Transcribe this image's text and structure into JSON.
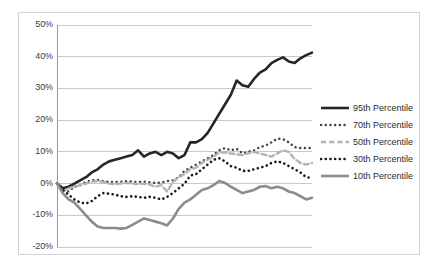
{
  "chart_data": {
    "type": "line",
    "title": "",
    "xlabel": "",
    "ylabel": "",
    "ylim": [
      -20,
      50
    ],
    "ytick_labels": [
      "50%",
      "40%",
      "30%",
      "20%",
      "10%",
      "0%",
      "-10%",
      "-20%"
    ],
    "ytick_values": [
      50,
      40,
      30,
      20,
      10,
      0,
      -10,
      -20
    ],
    "xlim": [
      0,
      44
    ],
    "xtick_labels": [],
    "grid": "horizontal",
    "legend_position": "right",
    "x": [
      0,
      1,
      2,
      3,
      4,
      5,
      6,
      7,
      8,
      9,
      10,
      11,
      12,
      13,
      14,
      15,
      16,
      17,
      18,
      19,
      20,
      21,
      22,
      23,
      24,
      25,
      26,
      27,
      28,
      29,
      30,
      31,
      32,
      33,
      34,
      35,
      36,
      37,
      38,
      39,
      40,
      41,
      42,
      43,
      44
    ],
    "series": [
      {
        "name": "95th Percentile",
        "color": "#262626",
        "style": "solid",
        "width": 2.6,
        "values": [
          0,
          -1.5,
          -1,
          0,
          1,
          2,
          3.5,
          4.5,
          6,
          7,
          7.5,
          8,
          8.5,
          9,
          10.5,
          8.5,
          9.5,
          10,
          9,
          10,
          9.5,
          8,
          9,
          13,
          13,
          14,
          16,
          19,
          22,
          25,
          28,
          32.5,
          31,
          30.5,
          33,
          35,
          36,
          38,
          39,
          39.8,
          38.5,
          38,
          39.5,
          40.5,
          41.3
        ]
      },
      {
        "name": "70th Percentile",
        "color": "#3f3f3f",
        "style": "dotted",
        "width": 2.4,
        "values": [
          0,
          -2,
          -2.5,
          -1,
          -0.5,
          0.5,
          1,
          1.2,
          0.8,
          0.5,
          0.5,
          0.6,
          0.8,
          0.6,
          0.5,
          0.6,
          0.4,
          0.2,
          0.3,
          0.8,
          1,
          2,
          4,
          5,
          6,
          7,
          8,
          9,
          10.5,
          11.2,
          10.5,
          11,
          9.5,
          10,
          10.5,
          11.5,
          12,
          13,
          14.2,
          14,
          13,
          11.5,
          11.2,
          11.2,
          11.2
        ]
      },
      {
        "name": "50th Percentile",
        "color": "#b3b3b3",
        "style": "dashed",
        "width": 2.4,
        "values": [
          0,
          -2.5,
          -1.5,
          -1,
          -0.5,
          0,
          0.6,
          0.8,
          0.5,
          0,
          -0.2,
          0,
          0.2,
          0,
          -0.2,
          0,
          -0.3,
          -1,
          -0.5,
          -2.5,
          0.5,
          2,
          3,
          4.5,
          5,
          6.5,
          7.5,
          8.5,
          9.8,
          9.8,
          9.5,
          9.2,
          9,
          9.5,
          10,
          9.5,
          9,
          8.5,
          9.5,
          10.5,
          10,
          7.8,
          6.5,
          6,
          6.5
        ]
      },
      {
        "name": "30th Percentile",
        "color": "#1a1a1a",
        "style": "dotted",
        "width": 2.6,
        "values": [
          0,
          -2,
          -3.5,
          -5,
          -6,
          -6.3,
          -5.5,
          -4,
          -3,
          -3.2,
          -3.5,
          -4,
          -4.2,
          -4,
          -4.2,
          -4.5,
          -4.2,
          -4.5,
          -5,
          -4.2,
          -3,
          -1.5,
          0,
          2.5,
          3,
          4.5,
          6,
          7.5,
          8,
          7,
          5.5,
          5,
          4,
          4,
          4.5,
          5,
          5.5,
          6.5,
          7,
          6.5,
          5.5,
          4.5,
          3.5,
          2,
          1.8
        ]
      },
      {
        "name": "10th Percentile",
        "color": "#8c8c8c",
        "style": "solid",
        "width": 2.6,
        "values": [
          0,
          -3,
          -5,
          -6,
          -8,
          -10,
          -12,
          -13.5,
          -14,
          -14,
          -14,
          -14.2,
          -14,
          -13,
          -12,
          -11,
          -11.5,
          -12,
          -12.5,
          -13.2,
          -11,
          -8,
          -6,
          -5,
          -3.5,
          -2,
          -1.5,
          -0.5,
          0.8,
          0.2,
          -1,
          -2,
          -3,
          -2.5,
          -2,
          -1,
          -0.8,
          -1.5,
          -1,
          -1.5,
          -2.5,
          -3,
          -4,
          -5,
          -4.5
        ]
      }
    ]
  },
  "legend": {
    "items": [
      {
        "label": "95th Percentile"
      },
      {
        "label": "70th Percentile"
      },
      {
        "label": "50th Percentile"
      },
      {
        "label": "30th Percentile"
      },
      {
        "label": "10th Percentile"
      }
    ]
  }
}
